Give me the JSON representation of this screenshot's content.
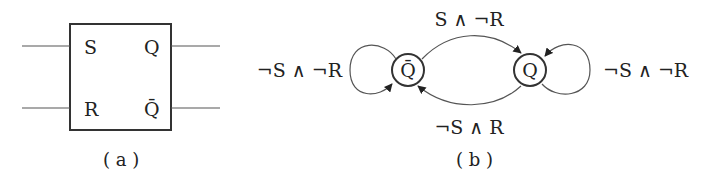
{
  "panel_a": {
    "caption": "( a )",
    "pins": {
      "s": "S",
      "r": "R",
      "q": "Q",
      "q_bar": "Q̄"
    }
  },
  "panel_b": {
    "caption": "( b )",
    "states": {
      "q_bar": "Q̄",
      "q": "Q"
    },
    "transitions": {
      "self_q_bar": "¬S ∧ ¬R",
      "q_bar_to_q": "S ∧ ¬R",
      "q_to_q_bar": "¬S ∧ R",
      "self_q": "¬S ∧ ¬R"
    }
  },
  "colors": {
    "stroke": "#333333",
    "text": "#222222"
  }
}
